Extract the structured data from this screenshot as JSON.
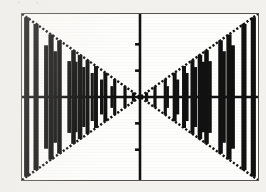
{
  "figure": {
    "clipped_caption_above": "· ·",
    "background_color": "#f2f1ee",
    "plot_background_color": "#fdfdfb",
    "ink_color": "#111111",
    "frame_color": "#565450",
    "frame": {
      "x": 21,
      "y": 13,
      "width": 238,
      "height": 168
    }
  },
  "chart_data": {
    "type": "line",
    "title": "",
    "xlabel": "",
    "ylabel": "",
    "grid": false,
    "legend": null,
    "xlim": [
      -6.3,
      6.3
    ],
    "ylim": [
      -6.3,
      6.3
    ],
    "axes": {
      "x_axis_y_value": 0,
      "y_axis_x_value": 0,
      "x_axis_pixel_y": 97,
      "y_axis_pixel_x": 140,
      "y_axis_tick_values": [
        -4,
        -2,
        2,
        4
      ],
      "y_axis_tick_pixels": [
        152,
        125,
        68,
        40
      ],
      "x_axis_tick_values": [],
      "tick_length_px": 5
    },
    "envelope": {
      "upper": {
        "expression": "y = |x|",
        "points_x": [
          -6.3,
          0,
          6.3
        ],
        "points_y": [
          6.3,
          0,
          6.3
        ]
      },
      "lower": {
        "expression": "y = -|x|",
        "points_x": [
          -6.3,
          0,
          6.3
        ],
        "points_y": [
          -6.3,
          0,
          -6.3
        ]
      }
    },
    "series": [
      {
        "name": "x*cos(omega*x) (aliased)",
        "expression": "y = x cos(ωx)",
        "render": "vertical-bars",
        "bars_x": [
          -6.05,
          -5.55,
          -4.75,
          -4.3,
          -3.55,
          -3.2,
          -2.8,
          -2.35,
          -1.85,
          -1.35,
          -0.8,
          -0.35,
          0.35,
          0.8,
          1.35,
          1.85,
          2.35,
          2.8,
          3.2,
          3.55,
          4.3,
          4.75,
          5.55,
          6.05
        ],
        "bars_top": [
          6.05,
          5.55,
          4.75,
          4.3,
          3.55,
          3.2,
          2.8,
          2.35,
          1.85,
          1.35,
          0.8,
          0.35,
          0.35,
          0.8,
          1.35,
          1.85,
          2.35,
          2.8,
          3.2,
          3.55,
          4.3,
          4.75,
          5.55,
          6.05
        ],
        "bars_bottom": [
          -6.05,
          -5.55,
          -4.75,
          -4.3,
          -3.55,
          -3.2,
          -2.8,
          -2.35,
          -1.85,
          -1.35,
          -0.8,
          -0.35,
          -0.35,
          -0.8,
          -1.35,
          -1.85,
          -2.35,
          -2.8,
          -3.2,
          -3.55,
          -4.3,
          -4.75,
          -5.55,
          -6.05
        ]
      }
    ]
  }
}
